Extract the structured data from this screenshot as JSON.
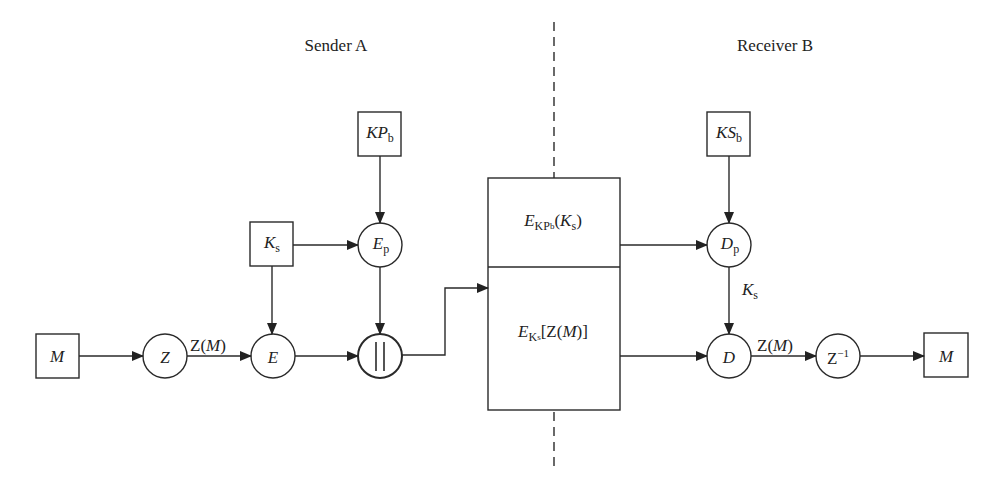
{
  "sections": {
    "sender": "Sender A",
    "receiver": "Receiver B"
  },
  "nodes": {
    "kp_b": {
      "main": "KP",
      "sub": "b"
    },
    "k_s": {
      "main": "K",
      "sub": "s"
    },
    "e_p": {
      "main": "E",
      "sub": "p"
    },
    "m_in": {
      "main": "M"
    },
    "z": {
      "main": "Z"
    },
    "e": {
      "main": "E"
    },
    "concat": {
      "main": "||"
    },
    "ks_b": {
      "main": "KS",
      "sub": "b"
    },
    "d_p": {
      "main": "D",
      "sub": "p"
    },
    "d": {
      "main": "D"
    },
    "z_inv": {
      "main": "Z",
      "sup": "−1"
    },
    "m_out": {
      "main": "M"
    }
  },
  "packet": {
    "top": {
      "E": "E",
      "sub1": "KP",
      "sub2": "b",
      "arg_open": "(",
      "arg": "K",
      "arg_sub": "s",
      "arg_close": ")"
    },
    "bottom": {
      "E": "E",
      "sub1": "K",
      "sub2": "s",
      "arg_open": "[Z(",
      "arg": "M",
      "arg_close": ")]"
    }
  },
  "edge_labels": {
    "zm_sender": {
      "pre": "Z(",
      "var": "M",
      "post": ")"
    },
    "ks_receiver": {
      "main": "K",
      "sub": "s"
    },
    "zm_receiver": {
      "pre": "Z(",
      "var": "M",
      "post": ")"
    }
  },
  "colors": {
    "stroke": "#2a2a2a",
    "background": "#ffffff"
  }
}
